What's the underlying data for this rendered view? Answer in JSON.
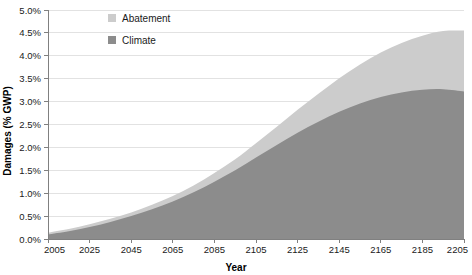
{
  "chart_data": {
    "type": "area",
    "stacked": true,
    "title": "",
    "xlabel": "Year",
    "ylabel": "Damages (% GWP)",
    "xlim": [
      2005,
      2205
    ],
    "ylim": [
      0.0,
      5.0
    ],
    "x_ticks": [
      "2005",
      "2025",
      "2045",
      "2065",
      "2085",
      "2105",
      "2125",
      "2145",
      "2165",
      "2185",
      "2205"
    ],
    "x_tick_values": [
      2005,
      2025,
      2045,
      2065,
      2085,
      2105,
      2125,
      2145,
      2165,
      2185,
      2205
    ],
    "y_ticks": [
      "0.0%",
      "0.5%",
      "1.0%",
      "1.5%",
      "2.0%",
      "2.5%",
      "3.0%",
      "3.5%",
      "4.0%",
      "4.5%",
      "5.0%"
    ],
    "y_tick_values": [
      0.0,
      0.5,
      1.0,
      1.5,
      2.0,
      2.5,
      3.0,
      3.5,
      4.0,
      4.5,
      5.0
    ],
    "grid": true,
    "legend_position": "top-left-inside",
    "x": [
      2005,
      2015,
      2025,
      2035,
      2045,
      2055,
      2065,
      2075,
      2085,
      2095,
      2105,
      2115,
      2125,
      2135,
      2145,
      2155,
      2165,
      2175,
      2185,
      2195,
      2205
    ],
    "series": [
      {
        "name": "Climate",
        "color": "#8c8c8c",
        "values": [
          0.1,
          0.17,
          0.26,
          0.37,
          0.5,
          0.65,
          0.82,
          1.02,
          1.25,
          1.5,
          1.78,
          2.05,
          2.32,
          2.56,
          2.78,
          2.96,
          3.1,
          3.2,
          3.26,
          3.27,
          3.22
        ]
      },
      {
        "name": "Abatement",
        "color": "#cccccc",
        "values": [
          0.04,
          0.05,
          0.06,
          0.07,
          0.08,
          0.1,
          0.12,
          0.15,
          0.19,
          0.24,
          0.31,
          0.4,
          0.5,
          0.61,
          0.73,
          0.85,
          0.97,
          1.08,
          1.18,
          1.27,
          1.33
        ]
      }
    ],
    "stack_totals": [
      0.14,
      0.22,
      0.32,
      0.44,
      0.58,
      0.75,
      0.94,
      1.17,
      1.44,
      1.74,
      2.09,
      2.45,
      2.82,
      3.17,
      3.51,
      3.81,
      4.07,
      4.28,
      4.44,
      4.54,
      4.55
    ],
    "legend": [
      {
        "label": "Abatement",
        "color": "#cccccc"
      },
      {
        "label": "Climate",
        "color": "#8c8c8c"
      }
    ]
  },
  "axes": {
    "x_title": "Year",
    "y_title": "Damages (% GWP)"
  }
}
